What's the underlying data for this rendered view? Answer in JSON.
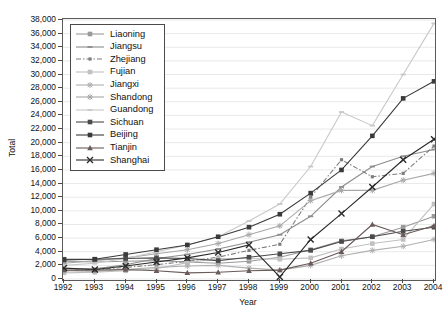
{
  "chart_data": {
    "type": "line",
    "title": "",
    "xlabel": "Year",
    "ylabel": "Total",
    "x": [
      1992,
      1993,
      1994,
      1995,
      1996,
      1997,
      1998,
      1999,
      2000,
      2001,
      2002,
      2003,
      2004
    ],
    "xlim": [
      1992,
      2004
    ],
    "ylim": [
      0,
      38000
    ],
    "ytick_step": 2000,
    "ytick_labels": [
      "0",
      "2,000",
      "4,000",
      "6,000",
      "8,000",
      "10,000",
      "12,000",
      "14,000",
      "16,000",
      "18,000",
      "20,000",
      "22,000",
      "24,000",
      "26,000",
      "28,000",
      "30,000",
      "32,000",
      "34,000",
      "36,000",
      "38,000"
    ],
    "xtick_labels": [
      "1992",
      "1993",
      "1994",
      "1995",
      "1996",
      "1997",
      "1998",
      "1999",
      "2000",
      "2001",
      "2002",
      "2003",
      "2004"
    ],
    "grid": "horizontal",
    "legend_position": "top-left-inside",
    "series": [
      {
        "name": "Liaoning",
        "color": "#9a9a9a",
        "marker": "square",
        "dash": "solid",
        "values": [
          2600,
          2500,
          2600,
          2700,
          2500,
          2300,
          2600,
          3200,
          4300,
          5600,
          6200,
          7600,
          9200
        ]
      },
      {
        "name": "Jiangsu",
        "color": "#8d8d8d",
        "marker": "dash",
        "dash": "solid",
        "values": [
          1500,
          1500,
          2100,
          3000,
          3600,
          4400,
          5400,
          6500,
          9200,
          13500,
          16500,
          18000,
          19000
        ]
      },
      {
        "name": "Zhejiang",
        "color": "#7d7d7d",
        "marker": "dot",
        "dash": "dashdot",
        "values": [
          1200,
          1400,
          1700,
          2100,
          2600,
          3200,
          4200,
          5100,
          12000,
          17500,
          15000,
          15500,
          19500
        ]
      },
      {
        "name": "Fujian",
        "color": "#c0c0c0",
        "marker": "square",
        "dash": "solid",
        "values": [
          900,
          1000,
          1200,
          1500,
          2400,
          3000,
          3000,
          2900,
          3100,
          4400,
          5200,
          5800,
          11000
        ]
      },
      {
        "name": "Jiangxi",
        "color": "#b0b0b0",
        "marker": "star",
        "dash": "solid",
        "values": [
          1200,
          1100,
          1400,
          1700,
          1900,
          2000,
          1600,
          1300,
          2000,
          3400,
          4200,
          4800,
          5800
        ]
      },
      {
        "name": "Shandong",
        "color": "#a8a8a8",
        "marker": "star",
        "dash": "solid",
        "values": [
          2300,
          2700,
          3100,
          3700,
          4300,
          5200,
          6500,
          7800,
          11500,
          13000,
          13000,
          14500,
          15500
        ]
      },
      {
        "name": "Guandong",
        "color": "#c8c8c8",
        "marker": "dash",
        "dash": "solid",
        "values": [
          2000,
          2300,
          3000,
          4000,
          5000,
          6200,
          8500,
          11000,
          16500,
          24500,
          22500,
          30000,
          37500
        ]
      },
      {
        "name": "Sichuan",
        "color": "#4a4a4a",
        "marker": "square",
        "dash": "solid",
        "values": [
          2900,
          2900,
          3000,
          3100,
          3000,
          2700,
          3200,
          3700,
          4200,
          5500,
          6200,
          7000,
          7600
        ]
      },
      {
        "name": "Beijing",
        "color": "#3a3a3a",
        "marker": "square",
        "dash": "solid",
        "values": [
          2800,
          2900,
          3600,
          4300,
          5000,
          6200,
          7600,
          9500,
          12600,
          16000,
          21000,
          26500,
          29000
        ]
      },
      {
        "name": "Tianjin",
        "color": "#6a5a5a",
        "marker": "triangle",
        "dash": "solid",
        "values": [
          1300,
          1300,
          1400,
          1200,
          900,
          1000,
          1200,
          1300,
          2300,
          4000,
          8000,
          6500,
          7800
        ]
      },
      {
        "name": "Shanghai",
        "color": "#2a2a2a",
        "marker": "cross",
        "dash": "solid",
        "values": [
          1600,
          1400,
          1900,
          2500,
          3100,
          3900,
          5000,
          300,
          5800,
          9600,
          13500,
          17500,
          20500
        ]
      }
    ]
  }
}
